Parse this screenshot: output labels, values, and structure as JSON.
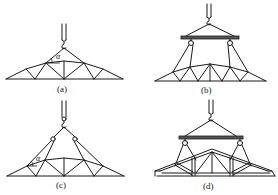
{
  "figure": {
    "colors": {
      "line": "#1a1a1a",
      "spreader_bar": "#555555",
      "background": "#ffffff"
    },
    "panels": [
      {
        "id": "a",
        "label": "(a)",
        "method": "single hook, two-point sling",
        "angle_symbol": "α",
        "has_spreader_bar": false
      },
      {
        "id": "b",
        "label": "(b)",
        "method": "spreader bar with pulleys, four-point sling",
        "has_spreader_bar": true
      },
      {
        "id": "c",
        "label": "(c)",
        "method": "single hook with two pulleys, four-point sling",
        "angle_symbol": "α",
        "has_spreader_bar": false
      },
      {
        "id": "d",
        "label": "(d)",
        "method": "spreader bar with pulleys, timber truss",
        "has_spreader_bar": true
      }
    ]
  }
}
